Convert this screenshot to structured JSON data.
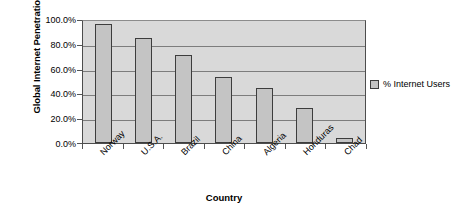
{
  "chart_data": {
    "type": "bar",
    "title": "",
    "xlabel": "Country",
    "ylabel": "Global Internet Penetration Rates",
    "categories": [
      "Norway",
      "U.S.A.",
      "Brazil",
      "China",
      "Algeria",
      "Honduras",
      "Chad"
    ],
    "values": [
      96,
      85,
      71,
      53,
      44,
      28,
      4
    ],
    "series": [
      {
        "name": "% Internet Users",
        "values": [
          96,
          85,
          71,
          53,
          44,
          28,
          4
        ]
      }
    ],
    "ylim": [
      0,
      100
    ],
    "ytick_values": [
      0,
      20,
      40,
      60,
      80,
      100
    ],
    "ytick_labels": [
      "0.0%",
      "20.0%",
      "40.0%",
      "60.0%",
      "80.0%",
      "100.0%"
    ],
    "grid": true,
    "legend_position": "right",
    "legend_entries": [
      "% Internet Users"
    ],
    "colors": {
      "bar_fill": "#c4c4c4",
      "bar_border": "#3d3d3d",
      "plot_background": "#d9d9d9",
      "gridline": "#7d7d7d",
      "axis": "#4d4d4d",
      "text": "#000000",
      "page_background": "#ffffff"
    }
  },
  "axes": {
    "y_title": "Global Internet Penetration Rates",
    "x_title": "Country"
  },
  "legend": {
    "items": [
      {
        "label": "% Internet Users"
      }
    ]
  }
}
